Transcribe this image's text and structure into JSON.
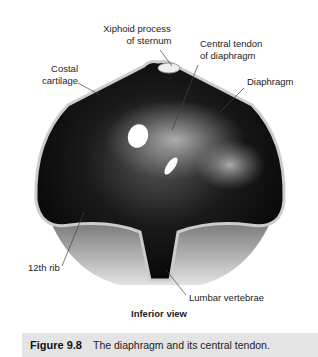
{
  "figure": {
    "labels": {
      "xiphoid": [
        "Xiphoid process",
        "of sternum"
      ],
      "central_tendon": [
        "Central tendon",
        "of diaphragm"
      ],
      "costal": [
        "Costal",
        "cartilage"
      ],
      "diaphragm": "Diaphragm",
      "rib12": "12th rib",
      "lumbar": "Lumbar vertebrae"
    },
    "view": "Inferior view",
    "caption": {
      "number": "Figure 9.8",
      "text": "The diaphragm and its central tendon."
    }
  }
}
